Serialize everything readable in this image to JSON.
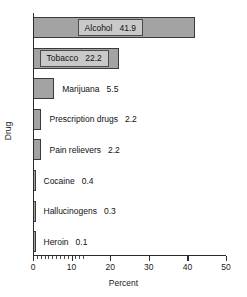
{
  "chart_data": {
    "type": "bar",
    "orientation": "horizontal",
    "title": "",
    "xlabel": "Percent",
    "ylabel": "Drug",
    "categories": [
      "Alcohol",
      "Tobacco",
      "Marijuana",
      "Prescription drugs",
      "Pain relievers",
      "Cocaine",
      "Hallucinogens",
      "Heroin"
    ],
    "values": [
      41.9,
      22.2,
      5.5,
      2.2,
      2.2,
      0.4,
      0.3,
      0.1
    ],
    "value_labels": [
      "41.9",
      "22.2",
      "5.5",
      "2.2",
      "2.2",
      "0.4",
      "0.3",
      "0.1"
    ],
    "label_placement": [
      "inside",
      "inside",
      "outside",
      "outside",
      "outside",
      "outside",
      "outside",
      "outside"
    ],
    "xlim": [
      0,
      50
    ],
    "xticks": [
      0,
      10,
      20,
      30,
      40,
      50
    ],
    "xtick_labels": [
      "0",
      "10",
      "20",
      "30",
      "40",
      "50"
    ],
    "minor_xticks": [
      1,
      2,
      3,
      4,
      5,
      6,
      7,
      8,
      9,
      10,
      11,
      12,
      13
    ],
    "grid": false,
    "legend": "none",
    "bar_color": "#a3a3a3",
    "bar_edge_color": "#3a3a3a",
    "axis_color": "#2b2b2b"
  }
}
